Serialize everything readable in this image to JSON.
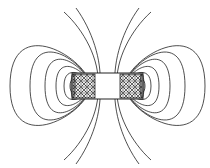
{
  "diagram": {
    "title": "",
    "colors": {
      "line": "#222222",
      "background": "#ffffff"
    },
    "solenoid": {
      "x": 72,
      "y": 73,
      "width": 71,
      "height": 26
    },
    "windings": [
      {
        "side": "left",
        "x": 72,
        "width": 23
      },
      {
        "side": "right",
        "x": 120,
        "width": 23
      }
    ],
    "closed_loops_per_side": 7,
    "open_arcs_per_side": 3
  }
}
